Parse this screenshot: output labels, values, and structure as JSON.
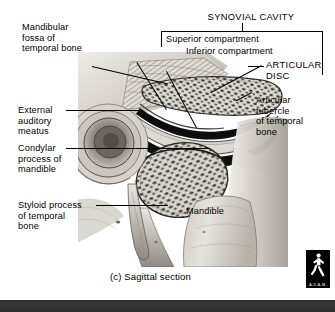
{
  "figure": {
    "caption": "(c) Sagittal section",
    "logo_text": "A.D.A.M.",
    "logo_icon": "walking-figure-icon"
  },
  "header": {
    "synovial_cavity": "SYNOVIAL CAVITY"
  },
  "labels": {
    "mandibular_fossa": "Mandibular\nfossa of\ntemporal bone",
    "external_auditory_meatus": "External\nauditory\nmeatus",
    "condylar_process": "Condylar\nprocess of\nmandible",
    "styloid_process": "Styloid process\nof temporal\nbone",
    "superior_compartment": "Superior compartment",
    "inferior_compartment": "Inferior compartment",
    "articular_disc": "ARTICULAR\nDISC",
    "articular_tubercle": "Articular\ntubercle\nof temporal\nbone",
    "mandible": "Mandible"
  },
  "colors": {
    "ink": "#000000",
    "background": "#ffffff",
    "band": "#2e2e2e",
    "bone_light": "#d8d4cd",
    "bone_mid": "#a9a49c",
    "bone_dark": "#6e6a63",
    "disc_black": "#111111"
  },
  "diagram": {
    "type": "anatomical-illustration",
    "view": "sagittal section",
    "structures": [
      "mandibular fossa of temporal bone",
      "external auditory meatus",
      "condylar process of mandible",
      "styloid process of temporal bone",
      "superior compartment",
      "inferior compartment",
      "articular disc",
      "articular tubercle of temporal bone",
      "mandible"
    ]
  }
}
